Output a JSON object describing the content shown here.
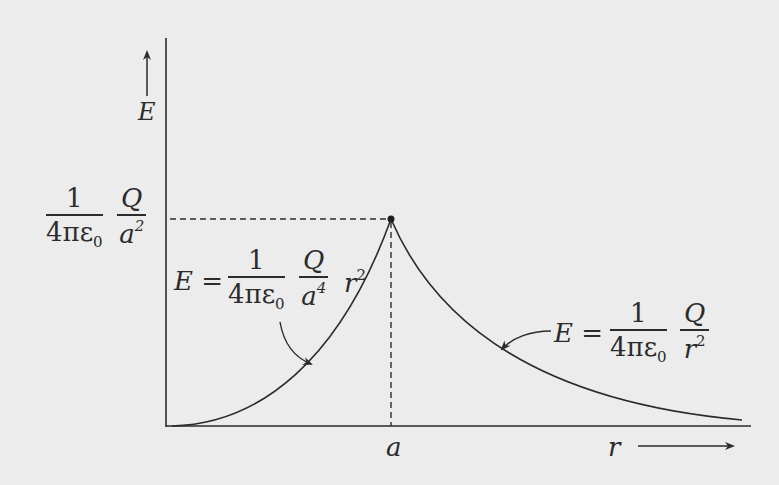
{
  "diagram": {
    "y_axis": {
      "label": "E",
      "arrow": "up-arrow"
    },
    "x_axis": {
      "label": "r",
      "arrow": "right-arrow",
      "marker_label": "a"
    },
    "peak_label": {
      "coef_num": "1",
      "coef_den_main": "4πε",
      "coef_den_sub": "0",
      "q_num": "Q",
      "q_den_main": "a",
      "q_den_sup": "2"
    },
    "inside_formula": {
      "lhs": "E =",
      "coef_num": "1",
      "coef_den_main": "4πε",
      "coef_den_sub": "0",
      "q_num": "Q",
      "q_den_main": "a",
      "q_den_sup": "4",
      "tail_main": "r",
      "tail_sup": "2"
    },
    "outside_formula": {
      "lhs": "E =",
      "coef_num": "1",
      "coef_den_main": "4πε",
      "coef_den_sub": "0",
      "q_num": "Q",
      "q_den_main": "r",
      "q_den_sup": "2"
    },
    "colors": {
      "background": "#ececec",
      "ink": "#2b2b2b"
    }
  }
}
